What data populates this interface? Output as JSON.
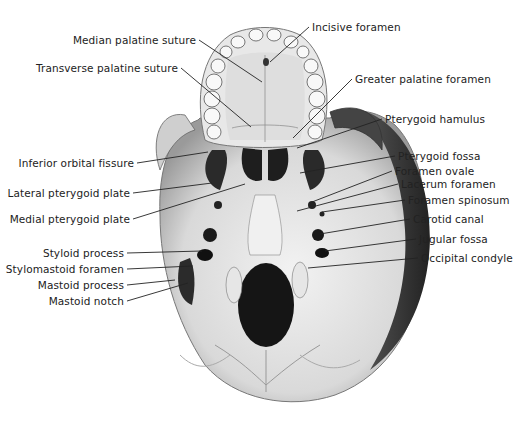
{
  "figure": {
    "labels_left": [
      {
        "id": "median-palatine-suture",
        "text": "Median palatine suture",
        "x": 199,
        "y": 40,
        "tx": 262,
        "ty": 82
      },
      {
        "id": "transverse-palatine-suture",
        "text": "Transverse palatine suture",
        "x": 181,
        "y": 68,
        "tx": 251,
        "ty": 127
      },
      {
        "id": "inferior-orbital-fissure",
        "text": "Inferior orbital fissure",
        "x": 137,
        "y": 163,
        "tx": 208,
        "ty": 152
      },
      {
        "id": "lateral-pterygoid-plate",
        "text": "Lateral pterygoid plate",
        "x": 133,
        "y": 193,
        "tx": 212,
        "ty": 183
      },
      {
        "id": "medial-pterygoid-plate",
        "text": "Medial pterygoid plate",
        "x": 133,
        "y": 219,
        "tx": 245,
        "ty": 184
      },
      {
        "id": "styloid-process",
        "text": "Styloid process",
        "x": 127,
        "y": 253,
        "tx": 202,
        "ty": 251
      },
      {
        "id": "stylomastoid-foramen",
        "text": "Stylomastoid foramen",
        "x": 127,
        "y": 269,
        "tx": 193,
        "ty": 266
      },
      {
        "id": "mastoid-process",
        "text": "Mastoid process",
        "x": 127,
        "y": 285,
        "tx": 175,
        "ty": 280
      },
      {
        "id": "mastoid-notch",
        "text": "Mastoid notch",
        "x": 127,
        "y": 301,
        "tx": 188,
        "ty": 283
      }
    ],
    "labels_right": [
      {
        "id": "incisive-foramen",
        "text": "Incisive foramen",
        "x": 309,
        "y": 27,
        "tx": 270,
        "ty": 62
      },
      {
        "id": "greater-palatine-foramen",
        "text": "Greater palatine foramen",
        "x": 352,
        "y": 79,
        "tx": 293,
        "ty": 138
      },
      {
        "id": "pterygoid-hamulus",
        "text": "Pterygoid hamulus",
        "x": 382,
        "y": 119,
        "tx": 297,
        "ty": 148
      },
      {
        "id": "pterygoid-fossa",
        "text": "Pterygoid fossa",
        "x": 395,
        "y": 156,
        "tx": 300,
        "ty": 173
      },
      {
        "id": "foramen-ovale",
        "text": "Foramen ovale",
        "x": 392,
        "y": 171,
        "tx": 312,
        "ty": 202
      },
      {
        "id": "lacerum-foramen",
        "text": "Lacerum foramen",
        "x": 398,
        "y": 184,
        "tx": 297,
        "ty": 211
      },
      {
        "id": "foramen-spinosum",
        "text": "Foramen spinosum",
        "x": 405,
        "y": 200,
        "tx": 322,
        "ty": 212
      },
      {
        "id": "carotid-canal",
        "text": "Carotid canal",
        "x": 410,
        "y": 219,
        "tx": 320,
        "ty": 234
      },
      {
        "id": "jugular-fossa",
        "text": "Jugular fossa",
        "x": 416,
        "y": 239,
        "tx": 325,
        "ty": 251
      },
      {
        "id": "occipital-condyle",
        "text": "Occipital condyle",
        "x": 418,
        "y": 258,
        "tx": 308,
        "ty": 268
      }
    ]
  }
}
